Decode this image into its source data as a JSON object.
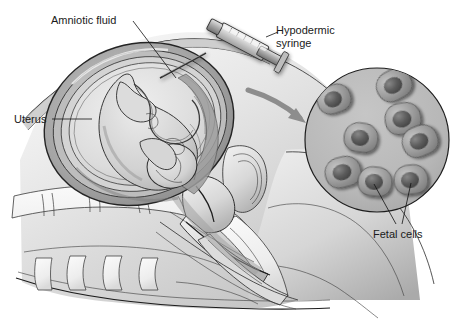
{
  "figure": {
    "view": "sagittal section of pregnant abdomen and pelvis with magnified inset",
    "style": "grayscale medical line-and-wash illustration",
    "width": 464,
    "height": 319,
    "background_color": "#ffffff"
  },
  "labels": {
    "amniotic_fluid": "Amniotic fluid",
    "hypodermic_syringe_line1": "Hypodermic",
    "hypodermic_syringe_line2": "syringe",
    "uterus": "Uterus",
    "fetal_cells": "Fetal cells"
  },
  "colors": {
    "ink": "#2b2b2b",
    "ink_dark": "#1d1d1d",
    "text": "#1a1a1a",
    "skin_light": "#e8e8e8",
    "skin_mid": "#d2d2d2",
    "skin_shade": "#b4b4b4",
    "uterus_wall": "#9a9a9a",
    "amniotic": "#dedede",
    "fetus": "#cfcfcf",
    "inset_fill": "#b9b9b9",
    "cell_body": "#9c9c9c",
    "cell_nucleus": "#5e5e5e",
    "arrow": "#8d8d8d",
    "syringe_barrel": "#dcdcdc",
    "syringe_metal": "#a8a8a8"
  },
  "inset": {
    "name": "fetal-cells-magnification",
    "shape": "circle",
    "center_x": 377,
    "center_y": 140,
    "radius": 72,
    "fill": "#b9b9b9",
    "cell_count": 8,
    "cells": [
      {
        "id": 1,
        "cx": 334,
        "cy": 99,
        "rx": 17,
        "ry": 14,
        "rot": -18
      },
      {
        "id": 2,
        "cx": 394,
        "cy": 85,
        "rx": 18,
        "ry": 15,
        "rot": -28
      },
      {
        "id": 3,
        "cx": 403,
        "cy": 119,
        "rx": 18,
        "ry": 16,
        "rot": -10
      },
      {
        "id": 4,
        "cx": 361,
        "cy": 138,
        "rx": 17,
        "ry": 15,
        "rot": 8
      },
      {
        "id": 5,
        "cx": 420,
        "cy": 141,
        "rx": 18,
        "ry": 15,
        "rot": -22
      },
      {
        "id": 6,
        "cx": 343,
        "cy": 172,
        "rx": 18,
        "ry": 15,
        "rot": -14
      },
      {
        "id": 7,
        "cx": 375,
        "cy": 182,
        "rx": 17,
        "ry": 15,
        "rot": 6
      },
      {
        "id": 8,
        "cx": 411,
        "cy": 180,
        "rx": 17,
        "ry": 15,
        "rot": -6
      }
    ]
  },
  "annotations": {
    "amniotic_fluid_leader": "line from label down-right to amniotic cavity near needle tip",
    "uterus_leader": "horizontal line from label right to uterine wall",
    "syringe_leader": "short line from label left to syringe barrel",
    "fetal_cells_leaders": "two lines forming a V up to two lower cells",
    "magnify_arrow": "curved gray arrow from abdomen to inset circle"
  },
  "elements": {
    "syringe": "hypodermic syringe angled down-left, needle entering abdominal wall",
    "fetus": "fetus curled head-down inside amniotic sac",
    "uterus_wall": "thick layered uterine wall",
    "spine": "lumbar vertebrae and sacrum",
    "pelvis": "pelvic floor, bladder, rectum, vagina section",
    "maternal_body": "maternal torso, abdomen and thigh outline"
  }
}
